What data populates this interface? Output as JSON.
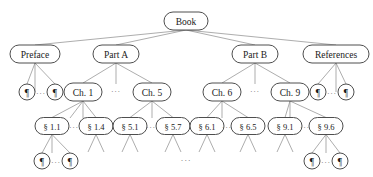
{
  "diagram": {
    "type": "tree",
    "canvas": {
      "width": 373,
      "height": 177,
      "background": "#ffffff"
    },
    "style": {
      "node_fill": "#ffffff",
      "node_stroke": "#3a3a3a",
      "edge_stroke": "#8a8a8a",
      "label_color": "#1a1a1a",
      "ellipsis_color": "#6f6f6f"
    },
    "glyphs": {
      "pilcrow": "¶",
      "section": "§",
      "ellipsis": "···"
    },
    "levels": [
      {
        "name": "root",
        "y": 21
      },
      {
        "name": "parts",
        "y": 54
      },
      {
        "name": "chapters",
        "y": 92
      },
      {
        "name": "sections",
        "y": 126
      },
      {
        "name": "paragraphs",
        "y": 161
      }
    ],
    "nodes": [
      {
        "id": "book",
        "label": "Book",
        "x": 186,
        "y": 21,
        "rx": 22,
        "ry": 9,
        "fs": 9.5,
        "kind": "root"
      },
      {
        "id": "preface",
        "label": "Preface",
        "x": 35,
        "y": 54,
        "rx": 25,
        "ry": 9,
        "fs": 9.5,
        "kind": "part"
      },
      {
        "id": "partA",
        "label": "Part A",
        "x": 116,
        "y": 54,
        "rx": 23,
        "ry": 9,
        "fs": 9.5,
        "kind": "part"
      },
      {
        "id": "partB",
        "label": "Part B",
        "x": 255,
        "y": 54,
        "rx": 23,
        "ry": 9,
        "fs": 9.5,
        "kind": "part"
      },
      {
        "id": "refs",
        "label": "References",
        "x": 336,
        "y": 54,
        "rx": 33,
        "ry": 9,
        "fs": 9.5,
        "kind": "part"
      },
      {
        "id": "pf_p1",
        "label": "¶",
        "x": 27,
        "y": 92,
        "rx": 8,
        "ry": 8,
        "fs": 9.5,
        "kind": "paragraph"
      },
      {
        "id": "pf_p2",
        "label": "¶",
        "x": 55,
        "y": 92,
        "rx": 8,
        "ry": 8,
        "fs": 9.5,
        "kind": "paragraph"
      },
      {
        "id": "ch1",
        "label": "Ch. 1",
        "x": 83,
        "y": 92,
        "rx": 19,
        "ry": 9,
        "fs": 9.5,
        "kind": "chapter"
      },
      {
        "id": "ch5",
        "label": "Ch. 5",
        "x": 152,
        "y": 92,
        "rx": 19,
        "ry": 9,
        "fs": 9.5,
        "kind": "chapter"
      },
      {
        "id": "ch6",
        "label": "Ch. 6",
        "x": 222,
        "y": 92,
        "rx": 19,
        "ry": 9,
        "fs": 9.5,
        "kind": "chapter"
      },
      {
        "id": "ch9",
        "label": "Ch. 9",
        "x": 290,
        "y": 92,
        "rx": 19,
        "ry": 9,
        "fs": 9.5,
        "kind": "chapter"
      },
      {
        "id": "rf_p1",
        "label": "¶",
        "x": 318,
        "y": 92,
        "rx": 8,
        "ry": 8,
        "fs": 9.5,
        "kind": "paragraph"
      },
      {
        "id": "rf_p2",
        "label": "¶",
        "x": 346,
        "y": 92,
        "rx": 8,
        "ry": 8,
        "fs": 9.5,
        "kind": "paragraph"
      },
      {
        "id": "s11",
        "label": "§ 1.1",
        "x": 52,
        "y": 126,
        "rx": 17,
        "ry": 8.5,
        "fs": 8.5,
        "kind": "section"
      },
      {
        "id": "s14",
        "label": "§ 1.4",
        "x": 96,
        "y": 126,
        "rx": 17,
        "ry": 8.5,
        "fs": 8.5,
        "kind": "section"
      },
      {
        "id": "s51",
        "label": "§ 5.1",
        "x": 130,
        "y": 126,
        "rx": 17,
        "ry": 8.5,
        "fs": 8.5,
        "kind": "section"
      },
      {
        "id": "s57",
        "label": "§ 5.7",
        "x": 173,
        "y": 126,
        "rx": 17,
        "ry": 8.5,
        "fs": 8.5,
        "kind": "section"
      },
      {
        "id": "s61",
        "label": "§ 6.1",
        "x": 207,
        "y": 126,
        "rx": 17,
        "ry": 8.5,
        "fs": 8.5,
        "kind": "section"
      },
      {
        "id": "s65",
        "label": "§ 6.5",
        "x": 248,
        "y": 126,
        "rx": 17,
        "ry": 8.5,
        "fs": 8.5,
        "kind": "section"
      },
      {
        "id": "s91",
        "label": "§ 9.1",
        "x": 285,
        "y": 126,
        "rx": 17,
        "ry": 8.5,
        "fs": 8.5,
        "kind": "section"
      },
      {
        "id": "s96",
        "label": "§ 9.6",
        "x": 326,
        "y": 126,
        "rx": 17,
        "ry": 8.5,
        "fs": 8.5,
        "kind": "section"
      },
      {
        "id": "s11_p1",
        "label": "¶",
        "x": 42,
        "y": 161,
        "rx": 8,
        "ry": 8,
        "fs": 9.5,
        "kind": "paragraph"
      },
      {
        "id": "s11_p2",
        "label": "¶",
        "x": 70,
        "y": 161,
        "rx": 8,
        "ry": 8,
        "fs": 9.5,
        "kind": "paragraph"
      },
      {
        "id": "s96_p1",
        "label": "¶",
        "x": 312,
        "y": 161,
        "rx": 8,
        "ry": 8,
        "fs": 9.5,
        "kind": "paragraph"
      },
      {
        "id": "s96_p2",
        "label": "¶",
        "x": 340,
        "y": 161,
        "rx": 8,
        "ry": 8,
        "fs": 9.5,
        "kind": "paragraph"
      }
    ],
    "ellipses": [
      {
        "id": "el_preface_children",
        "label": "···",
        "x": 41,
        "y": 93,
        "fs": 8
      },
      {
        "id": "el_partA_children",
        "label": "···",
        "x": 116,
        "y": 91,
        "fs": 8
      },
      {
        "id": "el_partB_children",
        "label": "···",
        "x": 255,
        "y": 91,
        "fs": 8
      },
      {
        "id": "el_refs_children",
        "label": "···",
        "x": 332,
        "y": 93,
        "fs": 8
      },
      {
        "id": "el_ch1_sections",
        "label": "···",
        "x": 74,
        "y": 127,
        "fs": 8
      },
      {
        "id": "el_ch5_sections",
        "label": "···",
        "x": 151,
        "y": 127,
        "fs": 8
      },
      {
        "id": "el_ch6_sections",
        "label": "···",
        "x": 227,
        "y": 127,
        "fs": 8
      },
      {
        "id": "el_ch9_sections",
        "label": "···",
        "x": 305,
        "y": 127,
        "fs": 8
      },
      {
        "id": "el_s11_paras",
        "label": "···",
        "x": 56,
        "y": 162,
        "fs": 8
      },
      {
        "id": "el_s96_paras",
        "label": "···",
        "x": 326,
        "y": 162,
        "fs": 8
      },
      {
        "id": "el_bottom_center",
        "label": "···",
        "x": 186,
        "y": 160,
        "fs": 9
      }
    ],
    "edges": [
      {
        "from": "book",
        "to": "preface"
      },
      {
        "from": "book",
        "to": "partA"
      },
      {
        "from": "book",
        "to": "partB"
      },
      {
        "from": "book",
        "to": "refs"
      },
      {
        "from": "preface",
        "to": "pf_p1"
      },
      {
        "from": "preface",
        "to": "pf_p2"
      },
      {
        "from": "preface",
        "to": "stub:35,92"
      },
      {
        "from": "partA",
        "to": "ch1"
      },
      {
        "from": "partA",
        "to": "ch5"
      },
      {
        "from": "partA",
        "to": "stub:116,84"
      },
      {
        "from": "partB",
        "to": "ch6"
      },
      {
        "from": "partB",
        "to": "ch9"
      },
      {
        "from": "partB",
        "to": "stub:255,84"
      },
      {
        "from": "refs",
        "to": "rf_p1"
      },
      {
        "from": "refs",
        "to": "rf_p2"
      },
      {
        "from": "refs",
        "to": "stub:336,92"
      },
      {
        "from": "ch1",
        "to": "s11"
      },
      {
        "from": "ch1",
        "to": "s14"
      },
      {
        "from": "ch1",
        "to": "stub:83,118"
      },
      {
        "from": "ch1",
        "to": "stub:70,118"
      },
      {
        "from": "ch5",
        "to": "s51"
      },
      {
        "from": "ch5",
        "to": "s57"
      },
      {
        "from": "ch5",
        "to": "stub:152,118"
      },
      {
        "from": "ch6",
        "to": "s61"
      },
      {
        "from": "ch6",
        "to": "s65"
      },
      {
        "from": "ch6",
        "to": "stub:222,118"
      },
      {
        "from": "ch9",
        "to": "s91"
      },
      {
        "from": "ch9",
        "to": "s96"
      },
      {
        "from": "ch9",
        "to": "stub:290,118"
      },
      {
        "from": "s11",
        "to": "s11_p1"
      },
      {
        "from": "s11",
        "to": "s11_p2"
      },
      {
        "from": "s11",
        "to": "stub:52,153"
      },
      {
        "from": "s14",
        "to": "stub:88,152"
      },
      {
        "from": "s14",
        "to": "stub:104,152"
      },
      {
        "from": "s51",
        "to": "stub:122,152"
      },
      {
        "from": "s51",
        "to": "stub:138,152"
      },
      {
        "from": "s57",
        "to": "stub:165,152"
      },
      {
        "from": "s57",
        "to": "stub:181,152"
      },
      {
        "from": "s61",
        "to": "stub:199,152"
      },
      {
        "from": "s61",
        "to": "stub:215,152"
      },
      {
        "from": "s65",
        "to": "stub:240,152"
      },
      {
        "from": "s65",
        "to": "stub:256,152"
      },
      {
        "from": "s91",
        "to": "stub:277,152"
      },
      {
        "from": "s91",
        "to": "stub:293,152"
      },
      {
        "from": "s96",
        "to": "s96_p1"
      },
      {
        "from": "s96",
        "to": "s96_p2"
      },
      {
        "from": "s96",
        "to": "stub:326,153"
      }
    ]
  }
}
